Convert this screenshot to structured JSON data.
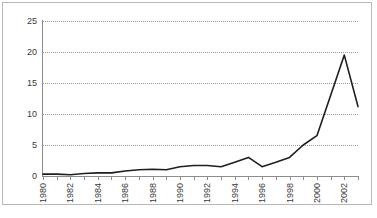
{
  "chart_data": {
    "type": "line",
    "title": "",
    "xlabel": "",
    "ylabel": "",
    "ylim": [
      0,
      25
    ],
    "yticks": [
      0,
      5,
      10,
      15,
      20,
      25
    ],
    "xlim": [
      1980,
      2003
    ],
    "grid": true,
    "legend": false,
    "legend_position": "none",
    "line_color": "#1f1f1f",
    "x": [
      1980,
      1981,
      1982,
      1983,
      1984,
      1985,
      1986,
      1987,
      1988,
      1989,
      1990,
      1991,
      1992,
      1993,
      1994,
      1995,
      1996,
      1997,
      1998,
      1999,
      2000,
      2001,
      2002,
      2003
    ],
    "values": [
      0.3,
      0.3,
      0.2,
      0.4,
      0.5,
      0.5,
      0.8,
      1.0,
      1.1,
      1.0,
      1.5,
      1.7,
      1.7,
      1.5,
      2.2,
      3.0,
      1.5,
      2.2,
      3.0,
      5.0,
      6.5,
      13.0,
      19.5,
      11.2
    ],
    "series": [
      {
        "name": "",
        "values": [
          0.3,
          0.3,
          0.2,
          0.4,
          0.5,
          0.5,
          0.8,
          1.0,
          1.1,
          1.0,
          1.5,
          1.7,
          1.7,
          1.5,
          2.2,
          3.0,
          1.5,
          2.2,
          3.0,
          5.0,
          6.5,
          13.0,
          19.5,
          11.2
        ]
      }
    ],
    "xtick_labels": [
      "1980",
      "1982",
      "1984",
      "1986",
      "1988",
      "1990",
      "1992",
      "1994",
      "1996",
      "1998",
      "2000",
      "2002"
    ],
    "xtick_label_years": [
      1980,
      1982,
      1984,
      1986,
      1988,
      1990,
      1992,
      1994,
      1996,
      1998,
      2000,
      2002
    ],
    "ytick_labels": [
      "0",
      "5",
      "10",
      "15",
      "20",
      "25"
    ]
  }
}
